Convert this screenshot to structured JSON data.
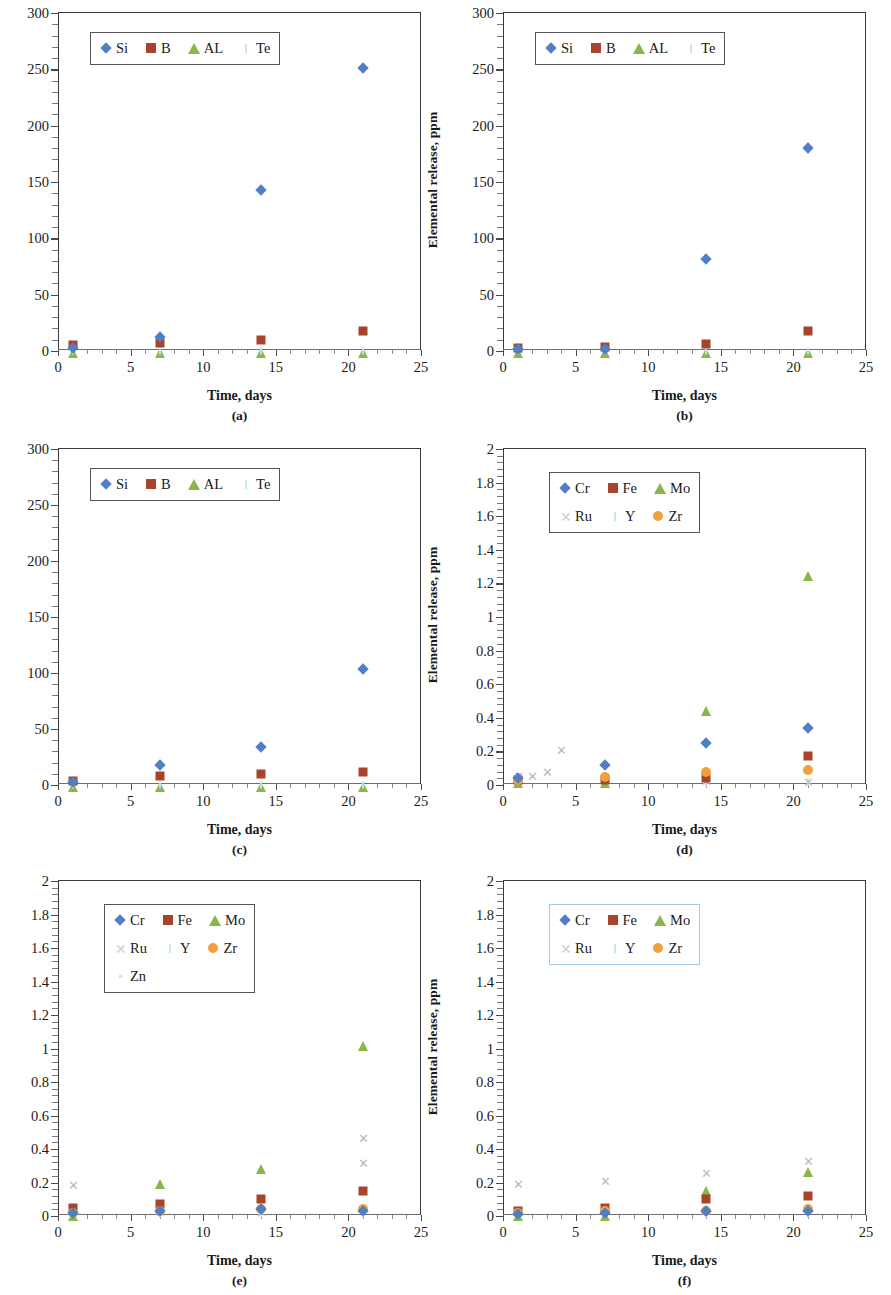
{
  "figure": {
    "axis_title_y": "Elemental release, ppm",
    "axis_title_x": "Time, days"
  },
  "colors": {
    "series_cr_si": "#4f7fc4",
    "series_fe_b": "#a8432c",
    "series_mo_al": "#89b84a",
    "series_ru": "#b9b9b9",
    "series_y_te": "#bde0f0",
    "series_zr": "#f2a03c",
    "series_zn": "#dcdcdc",
    "axis": "#3a3a3a"
  },
  "panels": [
    {
      "caption": "(a)",
      "yticks": [
        "0",
        "50",
        "100",
        "150",
        "200",
        "250",
        "300"
      ],
      "xticks": [
        "0",
        "5",
        "10",
        "15",
        "20",
        "25"
      ],
      "legend_rows": [
        [
          {
            "label": "Si",
            "marker": "diamond"
          },
          {
            "label": "B",
            "marker": "square"
          },
          {
            "label": "AL",
            "marker": "triangle"
          },
          {
            "label": "Te",
            "marker": "bar"
          }
        ]
      ]
    },
    {
      "caption": "(b)",
      "yticks": [
        "0",
        "50",
        "100",
        "150",
        "200",
        "250",
        "300"
      ],
      "xticks": [
        "0",
        "5",
        "10",
        "15",
        "20",
        "25"
      ],
      "legend_rows": [
        [
          {
            "label": "Si",
            "marker": "diamond"
          },
          {
            "label": "B",
            "marker": "square"
          },
          {
            "label": "AL",
            "marker": "triangle"
          },
          {
            "label": "Te",
            "marker": "bar"
          }
        ]
      ]
    },
    {
      "caption": "(c)",
      "yticks": [
        "0",
        "50",
        "100",
        "150",
        "200",
        "250",
        "300"
      ],
      "xticks": [
        "0",
        "5",
        "10",
        "15",
        "20",
        "25"
      ],
      "legend_rows": [
        [
          {
            "label": "Si",
            "marker": "diamond"
          },
          {
            "label": "B",
            "marker": "square"
          },
          {
            "label": "AL",
            "marker": "triangle"
          },
          {
            "label": "Te",
            "marker": "bar"
          }
        ]
      ]
    },
    {
      "caption": "(d)",
      "yticks": [
        "0",
        "0.2",
        "0.4",
        "0.6",
        "0.8",
        "1",
        "1.2",
        "1.4",
        "1.6",
        "1.8",
        "2"
      ],
      "xticks": [
        "0",
        "5",
        "10",
        "15",
        "20",
        "25"
      ],
      "legend_rows": [
        [
          {
            "label": "Cr",
            "marker": "diamond"
          },
          {
            "label": "Fe",
            "marker": "square"
          },
          {
            "label": "Mo",
            "marker": "triangle"
          }
        ],
        [
          {
            "label": "Ru",
            "marker": "x"
          },
          {
            "label": "Y",
            "marker": "bar"
          },
          {
            "label": "Zr",
            "marker": "circle"
          }
        ]
      ]
    },
    {
      "caption": "(e)",
      "yticks": [
        "0",
        "0.2",
        "0.4",
        "0.6",
        "0.8",
        "1",
        "1.2",
        "1.4",
        "1.6",
        "1.8",
        "2"
      ],
      "xticks": [
        "0",
        "5",
        "10",
        "15",
        "20",
        "25"
      ],
      "legend_rows": [
        [
          {
            "label": "Cr",
            "marker": "diamond"
          },
          {
            "label": "Fe",
            "marker": "square"
          },
          {
            "label": "Mo",
            "marker": "triangle"
          }
        ],
        [
          {
            "label": "Ru",
            "marker": "x"
          },
          {
            "label": "Y",
            "marker": "bar"
          },
          {
            "label": "Zr",
            "marker": "circle"
          }
        ],
        [
          {
            "label": "Zn",
            "marker": "dot"
          }
        ]
      ]
    },
    {
      "caption": "(f)",
      "yticks": [
        "0",
        "0.2",
        "0.4",
        "0.6",
        "0.8",
        "1",
        "1.2",
        "1.4",
        "1.6",
        "1.8",
        "2"
      ],
      "xticks": [
        "0",
        "5",
        "10",
        "15",
        "20",
        "25"
      ],
      "legend_rows": [
        [
          {
            "label": "Cr",
            "marker": "diamond"
          },
          {
            "label": "Fe",
            "marker": "square"
          },
          {
            "label": "Mo",
            "marker": "triangle"
          }
        ],
        [
          {
            "label": "Ru",
            "marker": "x"
          },
          {
            "label": "Y",
            "marker": "bar"
          },
          {
            "label": "Zr",
            "marker": "circle"
          }
        ]
      ]
    }
  ],
  "chart_data": [
    {
      "type": "scatter",
      "panel": "(a)",
      "title": "",
      "xlabel": "Time, days",
      "ylabel": "Elemental release, ppm",
      "xlim": [
        0,
        25
      ],
      "ylim": [
        0,
        300
      ],
      "xticks": [
        0,
        5,
        10,
        15,
        20,
        25
      ],
      "yticks": [
        0,
        50,
        100,
        150,
        200,
        250,
        300
      ],
      "grid": false,
      "legend_position": "upper-left",
      "x": [
        1,
        7,
        14,
        21
      ],
      "series": [
        {
          "name": "Si",
          "marker": "diamond",
          "color": "#4f7fc4",
          "values": [
            3,
            12,
            143,
            251
          ]
        },
        {
          "name": "B",
          "marker": "square",
          "color": "#a8432c",
          "values": [
            5,
            7,
            10,
            18
          ]
        },
        {
          "name": "AL",
          "marker": "triangle",
          "color": "#89b84a",
          "values": [
            0.5,
            0.5,
            0.5,
            0.5
          ]
        },
        {
          "name": "Te",
          "marker": "bar",
          "color": "#bde0f0",
          "values": [
            0,
            0,
            0,
            0
          ]
        }
      ]
    },
    {
      "type": "scatter",
      "panel": "(b)",
      "title": "",
      "xlabel": "Time, days",
      "ylabel": "Elemental release, ppm",
      "xlim": [
        0,
        25
      ],
      "ylim": [
        0,
        300
      ],
      "xticks": [
        0,
        5,
        10,
        15,
        20,
        25
      ],
      "yticks": [
        0,
        50,
        100,
        150,
        200,
        250,
        300
      ],
      "grid": false,
      "legend_position": "upper-left",
      "x": [
        1,
        7,
        14,
        21
      ],
      "series": [
        {
          "name": "Si",
          "marker": "diamond",
          "color": "#4f7fc4",
          "values": [
            1.5,
            2,
            82,
            180
          ]
        },
        {
          "name": "B",
          "marker": "square",
          "color": "#a8432c",
          "values": [
            2.5,
            3.5,
            6,
            18
          ]
        },
        {
          "name": "AL",
          "marker": "triangle",
          "color": "#89b84a",
          "values": [
            0.5,
            0.5,
            0.5,
            0.5
          ]
        },
        {
          "name": "Te",
          "marker": "bar",
          "color": "#bde0f0",
          "values": [
            0,
            0,
            0,
            0
          ]
        }
      ]
    },
    {
      "type": "scatter",
      "panel": "(c)",
      "title": "",
      "xlabel": "Time, days",
      "ylabel": "Elemental release, ppm",
      "xlim": [
        0,
        25
      ],
      "ylim": [
        0,
        300
      ],
      "xticks": [
        0,
        5,
        10,
        15,
        20,
        25
      ],
      "yticks": [
        0,
        50,
        100,
        150,
        200,
        250,
        300
      ],
      "grid": false,
      "legend_position": "upper-left",
      "x": [
        1,
        7,
        14,
        21
      ],
      "series": [
        {
          "name": "Si",
          "marker": "diamond",
          "color": "#4f7fc4",
          "values": [
            3,
            18,
            34,
            104
          ]
        },
        {
          "name": "B",
          "marker": "square",
          "color": "#a8432c",
          "values": [
            4,
            8,
            10,
            12
          ]
        },
        {
          "name": "AL",
          "marker": "triangle",
          "color": "#89b84a",
          "values": [
            0.5,
            0.5,
            0.5,
            0.5
          ]
        },
        {
          "name": "Te",
          "marker": "bar",
          "color": "#bde0f0",
          "values": [
            0,
            0,
            0,
            0
          ]
        }
      ]
    },
    {
      "type": "scatter",
      "panel": "(d)",
      "title": "",
      "xlabel": "Time, days",
      "ylabel": "Elemental release, ppm",
      "xlim": [
        0,
        25
      ],
      "ylim": [
        0,
        2
      ],
      "xticks": [
        0,
        5,
        10,
        15,
        20,
        25
      ],
      "yticks": [
        0,
        0.2,
        0.4,
        0.6,
        0.8,
        1,
        1.2,
        1.4,
        1.6,
        1.8,
        2
      ],
      "grid": false,
      "legend_position": "upper-left",
      "x": [
        1,
        7,
        14,
        21
      ],
      "series": [
        {
          "name": "Cr",
          "marker": "diamond",
          "color": "#4f7fc4",
          "values": [
            0.04,
            0.12,
            0.25,
            0.34
          ]
        },
        {
          "name": "Fe",
          "marker": "square",
          "color": "#a8432c",
          "values": [
            0.03,
            0.03,
            0.04,
            0.17
          ]
        },
        {
          "name": "Mo",
          "marker": "triangle",
          "color": "#89b84a",
          "values": [
            0.03,
            0.03,
            0.46,
            1.26
          ]
        },
        {
          "name": "Ru",
          "marker": "x",
          "color": "#b9b9b9",
          "values": [
            0.05,
            0.04,
            0.02,
            0.01
          ],
          "extra_points": [
            {
              "x": 2,
              "y": 0.05
            },
            {
              "x": 3,
              "y": 0.07
            },
            {
              "x": 4,
              "y": 0.2
            }
          ]
        },
        {
          "name": "Y",
          "marker": "bar",
          "color": "#bde0f0",
          "values": [
            0.01,
            0.01,
            0.01,
            0.02
          ]
        },
        {
          "name": "Zr",
          "marker": "circle",
          "color": "#f2a03c",
          "values": [
            0.03,
            0.05,
            0.08,
            0.09
          ]
        }
      ]
    },
    {
      "type": "scatter",
      "panel": "(e)",
      "title": "",
      "xlabel": "Time, days",
      "ylabel": "Elemental release, ppm",
      "xlim": [
        0,
        25
      ],
      "ylim": [
        0,
        2
      ],
      "xticks": [
        0,
        5,
        10,
        15,
        20,
        25
      ],
      "yticks": [
        0,
        0.2,
        0.4,
        0.6,
        0.8,
        1,
        1.2,
        1.4,
        1.6,
        1.8,
        2
      ],
      "grid": false,
      "legend_position": "upper-left",
      "x": [
        1,
        7,
        14,
        21
      ],
      "series": [
        {
          "name": "Cr",
          "marker": "diamond",
          "color": "#4f7fc4",
          "values": [
            0.02,
            0.03,
            0.04,
            0.03
          ]
        },
        {
          "name": "Fe",
          "marker": "square",
          "color": "#a8432c",
          "values": [
            0.05,
            0.07,
            0.1,
            0.15
          ]
        },
        {
          "name": "Mo",
          "marker": "triangle",
          "color": "#89b84a",
          "values": [
            0.02,
            0.21,
            0.3,
            1.03
          ]
        },
        {
          "name": "Ru",
          "marker": "x",
          "color": "#b9b9b9",
          "values": [
            0.18,
            0.02,
            0.02,
            0.31
          ],
          "extra_points": [
            {
              "x": 21,
              "y": 0.46
            }
          ]
        },
        {
          "name": "Y",
          "marker": "bar",
          "color": "#bde0f0",
          "values": [
            0.01,
            0.01,
            0.01,
            0.01
          ]
        },
        {
          "name": "Zr",
          "marker": "circle",
          "color": "#f2a03c",
          "values": [
            0.02,
            0.03,
            0.04,
            0.04
          ]
        },
        {
          "name": "Zn",
          "marker": "dot",
          "color": "#dcdcdc",
          "values": [
            0.01,
            0.01,
            0.01,
            0.01
          ]
        }
      ]
    },
    {
      "type": "scatter",
      "panel": "(f)",
      "title": "",
      "xlabel": "Time, days",
      "ylabel": "Elemental release, ppm",
      "xlim": [
        0,
        25
      ],
      "ylim": [
        0,
        2
      ],
      "xticks": [
        0,
        5,
        10,
        15,
        20,
        25
      ],
      "yticks": [
        0,
        0.2,
        0.4,
        0.6,
        0.8,
        1,
        1.2,
        1.4,
        1.6,
        1.8,
        2
      ],
      "grid": false,
      "legend_position": "upper-left",
      "x": [
        1,
        7,
        14,
        21
      ],
      "series": [
        {
          "name": "Cr",
          "marker": "diamond",
          "color": "#4f7fc4",
          "values": [
            0.01,
            0.02,
            0.03,
            0.03
          ]
        },
        {
          "name": "Fe",
          "marker": "square",
          "color": "#a8432c",
          "values": [
            0.03,
            0.05,
            0.1,
            0.12
          ]
        },
        {
          "name": "Mo",
          "marker": "triangle",
          "color": "#89b84a",
          "values": [
            0.02,
            0.02,
            0.17,
            0.28
          ]
        },
        {
          "name": "Ru",
          "marker": "x",
          "color": "#b9b9b9",
          "values": [
            0.185,
            0.205,
            0.25,
            0.32
          ]
        },
        {
          "name": "Y",
          "marker": "bar",
          "color": "#bde0f0",
          "values": [
            0.01,
            0.01,
            0.01,
            0.01
          ]
        },
        {
          "name": "Zr",
          "marker": "circle",
          "color": "#f2a03c",
          "values": [
            0.02,
            0.03,
            0.03,
            0.04
          ]
        }
      ]
    }
  ]
}
